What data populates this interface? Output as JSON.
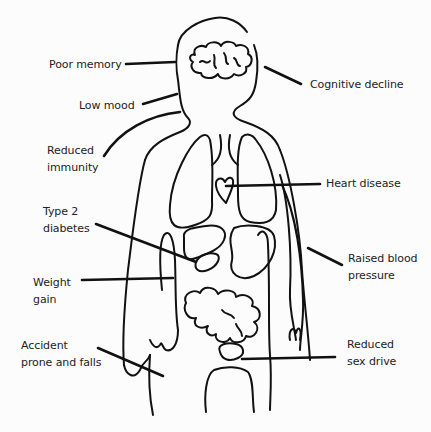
{
  "diagram": {
    "labels": [
      {
        "id": "poor-memory",
        "lines": [
          "Poor memory"
        ]
      },
      {
        "id": "low-mood",
        "lines": [
          "Low mood"
        ]
      },
      {
        "id": "reduced-immunity",
        "lines": [
          "Reduced",
          "immunity"
        ]
      },
      {
        "id": "type2-diabetes",
        "lines": [
          "Type 2",
          "diabetes"
        ]
      },
      {
        "id": "weight-gain",
        "lines": [
          "Weight",
          "gain"
        ]
      },
      {
        "id": "accident-prone",
        "lines": [
          "Accident",
          "prone and falls"
        ]
      },
      {
        "id": "cognitive-decline",
        "lines": [
          "Cognitive decline"
        ]
      },
      {
        "id": "heart-disease",
        "lines": [
          "Heart disease"
        ]
      },
      {
        "id": "raised-blood-pressure",
        "lines": [
          "Raised blood",
          "pressure"
        ]
      },
      {
        "id": "reduced-sex-drive",
        "lines": [
          "Reduced",
          "sex drive"
        ]
      }
    ],
    "organs": [
      "brain",
      "lungs",
      "heart",
      "stomach",
      "liver",
      "pancreas",
      "intestines",
      "bladder",
      "blood-vessels"
    ],
    "colors": {
      "ink": "#111111",
      "text": "#222222",
      "background": "#fcfcfc"
    }
  }
}
